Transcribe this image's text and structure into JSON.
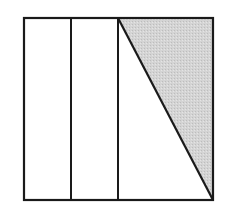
{
  "figure": {
    "type": "geometry-diagram",
    "square": {
      "x": 24,
      "y": 18,
      "width": 189,
      "height": 182
    },
    "dividers_x": [
      71,
      118
    ],
    "diagonal": {
      "x1": 118,
      "y1": 18,
      "x2": 213,
      "y2": 200
    },
    "shaded_triangle": {
      "points": "118,18 213,18 213,200"
    },
    "colors": {
      "stroke": "#1a1a1a",
      "fill": "#d2d2d2",
      "background": "#ffffff"
    },
    "stroke_width": 2.2
  }
}
